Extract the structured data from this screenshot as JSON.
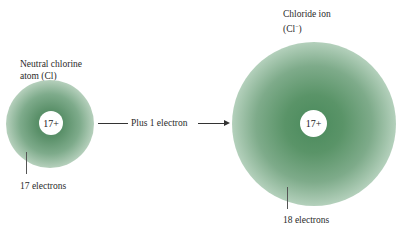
{
  "diagram": {
    "neutral_atom": {
      "title_line1": "Neutral chlorine",
      "title_line2": "atom (Cl)",
      "nucleus_charge": "17+",
      "electron_label": "17 electrons"
    },
    "transition": {
      "label": "Plus 1 electron"
    },
    "ion": {
      "title_line1": "Chloride ion",
      "title_line2_prefix": "(Cl",
      "title_line2_superscript": "−",
      "title_line2_suffix": ")",
      "nucleus_charge": "17+",
      "electron_label": "18 electrons"
    },
    "colors": {
      "electron_cloud": "#5a9069",
      "nucleus": "#ffffff",
      "text": "#2a2a2a"
    }
  }
}
